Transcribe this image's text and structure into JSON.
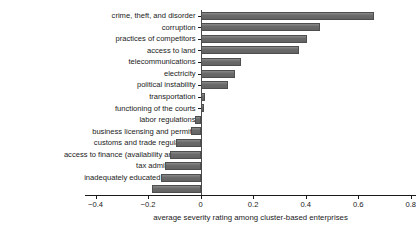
{
  "chart_data": {
    "type": "bar",
    "orientation": "horizontal",
    "title": "",
    "subtitle": "",
    "xlabel": "average severity rating among cluster-based enterprises",
    "ylabel": "",
    "xlim": [
      -0.44,
      0.82
    ],
    "xticks": [
      -0.4,
      -0.2,
      0,
      0.2,
      0.4,
      0.6,
      0.8
    ],
    "xticklabels": [
      "−0.4",
      "−0.2",
      "0",
      "0.2",
      "0.4",
      "0.6",
      "0.8"
    ],
    "grid": false,
    "legend": null,
    "bar_color": "#6b6b6b",
    "categories": [
      "crime, theft, and disorder",
      "corruption",
      "practices of competitors",
      "access to land",
      "telecommunications",
      "electricity",
      "political instability",
      "transportation",
      "functioning of the courts",
      "labor regulations",
      "business licensing and permits",
      "customs and trade regulations",
      "access to finance (availability and cost)",
      "tax administration",
      "inadequately educated workforce",
      "tax rates"
    ],
    "values": [
      0.66,
      0.455,
      0.405,
      0.375,
      0.155,
      0.13,
      0.103,
      0.017,
      0.012,
      -0.022,
      -0.038,
      -0.095,
      -0.118,
      -0.137,
      -0.152,
      -0.185
    ]
  }
}
